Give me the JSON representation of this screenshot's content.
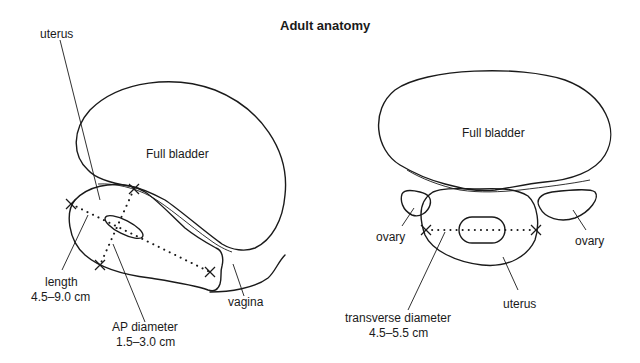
{
  "title": "Adult anatomy",
  "sagittal_view": {
    "bladder_label": "Full bladder",
    "uterus_label": "uterus",
    "length_label": "length",
    "length_value": "4.5–9.0 cm",
    "ap_label": "AP diameter",
    "ap_value": "1.5–3.0 cm",
    "vagina_label": "vagina"
  },
  "transverse_view": {
    "bladder_label": "Full bladder",
    "ovary_left_label": "ovary",
    "ovary_right_label": "ovary",
    "uterus_label": "uterus",
    "transverse_label": "transverse diameter",
    "transverse_value": "4.5–5.5 cm"
  }
}
